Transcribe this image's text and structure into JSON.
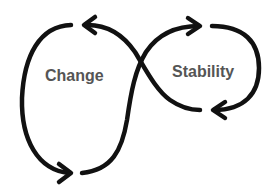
{
  "diagram": {
    "type": "infinity-loop",
    "labels": {
      "left": "Change",
      "right": "Stability"
    },
    "colors": {
      "stroke": "#111111",
      "text": "#555555",
      "background": "#ffffff"
    }
  }
}
